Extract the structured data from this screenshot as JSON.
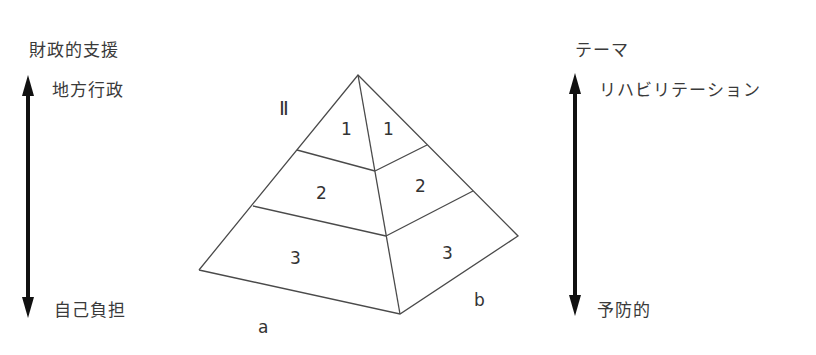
{
  "left_axis": {
    "title": "財政的支援",
    "top_label": "地方行政",
    "bottom_label": "自己負担"
  },
  "right_axis": {
    "title": "テーマ",
    "top_label": "リハビリテーション",
    "bottom_label": "予防的"
  },
  "pyramid": {
    "roman_label": "Ⅱ",
    "face_a": {
      "label": "a",
      "bands": [
        "1",
        "2",
        "3"
      ]
    },
    "face_b": {
      "label": "b",
      "bands": [
        "1",
        "2",
        "3"
      ]
    }
  },
  "colors": {
    "line": "#4a4a4a",
    "arrow": "#111111",
    "text": "#3a3a3a"
  }
}
